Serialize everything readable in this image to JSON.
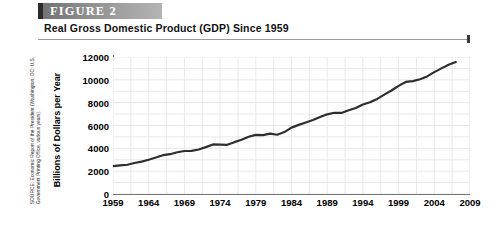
{
  "figure": {
    "banner_label": "FIGURE  2",
    "title": "Real Gross Domestic Product (GDP) Since 1959",
    "source": "SOURCE: Economic Report of the President (Washington, DC: U.S. Government Printing Office, various years)."
  },
  "colors": {
    "banner_dark": "#2b2b2b",
    "banner_gray": "#8b8b8b",
    "line": "#2e2e2e",
    "grid": "#e8e8e8",
    "axis": "#767676"
  },
  "chart_data": {
    "type": "line",
    "title": "Real Gross Domestic Product (GDP) Since 1959",
    "xlabel": "",
    "ylabel": "Billions of Dollars per Year",
    "xlim": [
      1959,
      2009
    ],
    "ylim": [
      0,
      12000
    ],
    "grid": true,
    "legend": "none",
    "xticks": [
      "1959",
      "1964",
      "1969",
      "1974",
      "1979",
      "1984",
      "1989",
      "1994",
      "1999",
      "2004",
      "2009"
    ],
    "yticks": [
      "0",
      "2000",
      "4000",
      "6000",
      "8000",
      "10000",
      "12000"
    ],
    "series": [
      {
        "name": "Real GDP",
        "x": [
          1959,
          1960,
          1961,
          1962,
          1963,
          1964,
          1965,
          1966,
          1967,
          1968,
          1969,
          1970,
          1971,
          1972,
          1973,
          1974,
          1975,
          1976,
          1977,
          1978,
          1979,
          1980,
          1981,
          1982,
          1983,
          1984,
          1985,
          1986,
          1987,
          1988,
          1989,
          1990,
          1991,
          1992,
          1993,
          1994,
          1995,
          1996,
          1997,
          1998,
          1999,
          2000,
          2001,
          2002,
          2003,
          2004,
          2005,
          2006,
          2007
        ],
        "values": [
          2442,
          2502,
          2560,
          2715,
          2834,
          2999,
          3192,
          3399,
          3485,
          3653,
          3766,
          3772,
          3899,
          4105,
          4342,
          4320,
          4311,
          4541,
          4751,
          5015,
          5173,
          5162,
          5292,
          5189,
          5424,
          5814,
          6054,
          6264,
          6475,
          6743,
          6981,
          7113,
          7101,
          7337,
          7533,
          7836,
          8032,
          8329,
          8704,
          9067,
          9470,
          9817,
          9891,
          10049,
          10301,
          10676,
          11004,
          11319,
          11567
        ]
      }
    ]
  }
}
